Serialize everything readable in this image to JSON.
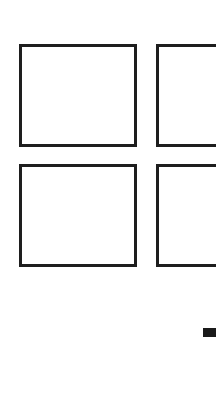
{
  "grid": {
    "tiles": [
      {
        "position": "top-left"
      },
      {
        "position": "top-right"
      },
      {
        "position": "bottom-left"
      },
      {
        "position": "bottom-right"
      }
    ],
    "border_color": "#1e1e1e",
    "background_color": "#ffffff"
  },
  "indicator": {
    "color": "#1a1a1a"
  }
}
